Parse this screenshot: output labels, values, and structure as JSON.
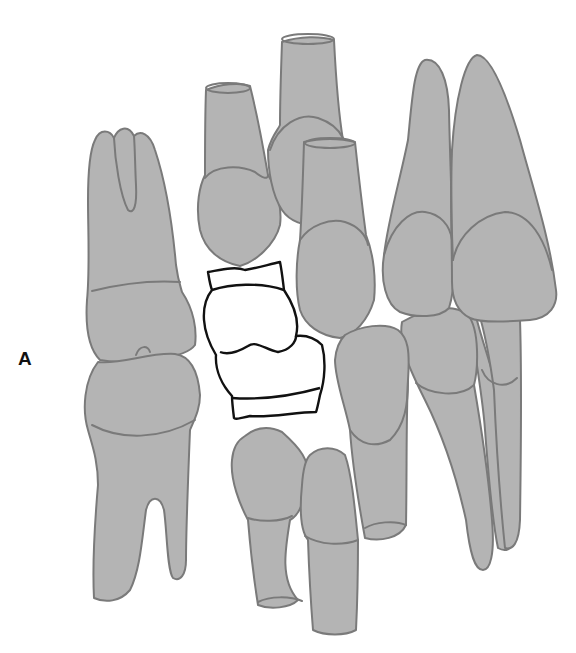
{
  "figure": {
    "panel_label": "A"
  },
  "colors": {
    "background": "#ffffff",
    "tooth_fill": "#b4b4b4",
    "tooth_outline": "#7a7a7a",
    "highlight_fill": "#ffffff",
    "highlight_outline": "#111111",
    "label": "#111111"
  },
  "teeth": [
    {
      "id": "molar-left-upper",
      "type": "molar",
      "highlighted": false
    },
    {
      "id": "molar-left-lower",
      "type": "molar",
      "highlighted": false
    },
    {
      "id": "premolar-upper-1",
      "type": "premolar",
      "highlighted": false
    },
    {
      "id": "premolar-upper-2",
      "type": "premolar",
      "highlighted": false
    },
    {
      "id": "premolar-upper-3",
      "type": "premolar",
      "highlighted": false
    },
    {
      "id": "highlighted-tooth",
      "type": "premolar-pair",
      "highlighted": true
    },
    {
      "id": "premolar-lower-1",
      "type": "premolar",
      "highlighted": false
    },
    {
      "id": "premolar-lower-2",
      "type": "premolar",
      "highlighted": false
    },
    {
      "id": "canine-lower",
      "type": "canine",
      "highlighted": false
    },
    {
      "id": "incisor-upper-lateral",
      "type": "incisor",
      "highlighted": false
    },
    {
      "id": "incisor-upper-central",
      "type": "incisor",
      "highlighted": false
    },
    {
      "id": "incisor-lower-1",
      "type": "incisor",
      "highlighted": false
    },
    {
      "id": "incisor-lower-2",
      "type": "incisor",
      "highlighted": false
    }
  ]
}
